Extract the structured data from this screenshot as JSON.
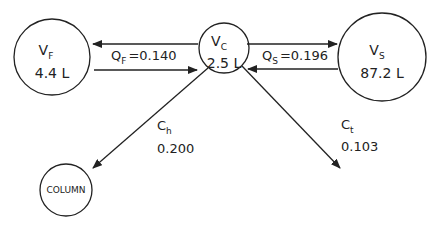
{
  "colors": {
    "stroke": "#222222",
    "text": "#222222",
    "background": "#ffffff"
  },
  "nodes": {
    "vf": {
      "symbol": "V",
      "subscript": "F",
      "value": "4.4 L"
    },
    "vc": {
      "symbol": "V",
      "subscript": "C",
      "value": "2.5 L"
    },
    "vs": {
      "symbol": "V",
      "subscript": "S",
      "value": "87.2 L"
    },
    "column": {
      "label": "COLUMN"
    }
  },
  "flows": {
    "qf": {
      "symbol": "Q",
      "subscript": "F",
      "value": "=0.140"
    },
    "qs": {
      "symbol": "Q",
      "subscript": "S",
      "value": "=0.196"
    },
    "ch": {
      "symbol": "C",
      "subscript": "h",
      "value": "0.200"
    },
    "ct": {
      "symbol": "C",
      "subscript": "t",
      "value": "0.103"
    }
  }
}
